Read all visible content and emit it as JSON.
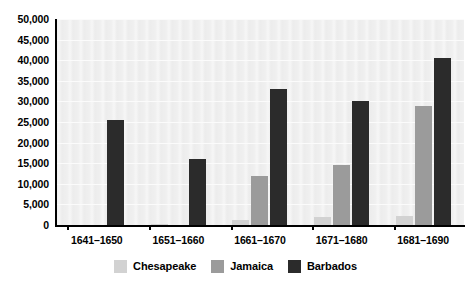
{
  "chart_data": {
    "type": "bar",
    "title": "",
    "subtitle": "",
    "xlabel": "",
    "ylabel": "",
    "categories": [
      "1641–1650",
      "1651–1660",
      "1661–1670",
      "1671–1680",
      "1681–1690"
    ],
    "series": [
      {
        "name": "Chesapeake",
        "color": "#d2d2d2",
        "values": [
          0,
          300,
          1200,
          2000,
          2100
        ]
      },
      {
        "name": "Jamaica",
        "color": "#9b9b9b",
        "values": [
          0,
          0,
          12000,
          14500,
          29000
        ]
      },
      {
        "name": "Barbados",
        "color": "#2b2b2b",
        "values": [
          25500,
          16000,
          33000,
          30000,
          40500
        ]
      }
    ],
    "ylim": [
      0,
      50000
    ],
    "ytick_step": 5000,
    "ytick_labels": [
      "50,000",
      "45,000",
      "40,000",
      "35,000",
      "30,000",
      "25,000",
      "20,000",
      "15,000",
      "10,000",
      "5,000",
      "0"
    ],
    "ytick_values": [
      50000,
      45000,
      40000,
      35000,
      30000,
      25000,
      20000,
      15000,
      10000,
      5000,
      0
    ],
    "grid": true,
    "legend_position": "bottom",
    "plot_background": "#efefef",
    "axis_color": "#000000"
  },
  "legend": {
    "items": [
      {
        "label": "Chesapeake",
        "color": "#d2d2d2"
      },
      {
        "label": "Jamaica",
        "color": "#9b9b9b"
      },
      {
        "label": "Barbados",
        "color": "#2b2b2b"
      }
    ]
  }
}
